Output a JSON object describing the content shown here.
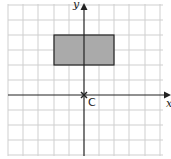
{
  "diagram": {
    "x_axis_label": "x",
    "y_axis_label": "y",
    "center_label": "C",
    "grid_spacing_px": 15.2,
    "colors": {
      "grid": "#cfcfcf",
      "axis": "#222222",
      "rect_fill": "#aaaaaa",
      "rect_stroke": "#222222"
    },
    "rectangle": {
      "x_from": -2,
      "x_to": 2,
      "y_from": 2,
      "y_to": 4
    },
    "center_point": {
      "x": 0,
      "y": 0
    }
  }
}
